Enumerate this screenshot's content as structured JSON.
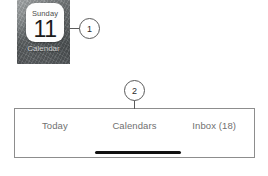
{
  "background_color": "#ffffff",
  "app_icon": {
    "tile_weekday": "Sunday",
    "tile_day_number": "11",
    "caption": "Calendar",
    "tile_background": "#fdfdfd",
    "wallpaper_color": "#6e7375"
  },
  "callouts": [
    {
      "label": "1",
      "name": "callout-marker-1"
    },
    {
      "label": "2",
      "name": "callout-marker-2"
    }
  ],
  "tab_bar": {
    "border_color": "#8d8d8d",
    "text_color": "#707070",
    "tabs": [
      {
        "label": "Today",
        "name": "tab-today"
      },
      {
        "label": "Calendars",
        "name": "tab-calendars"
      },
      {
        "label": "Inbox (18)",
        "name": "tab-inbox"
      }
    ],
    "home_indicator_color": "#111111"
  }
}
